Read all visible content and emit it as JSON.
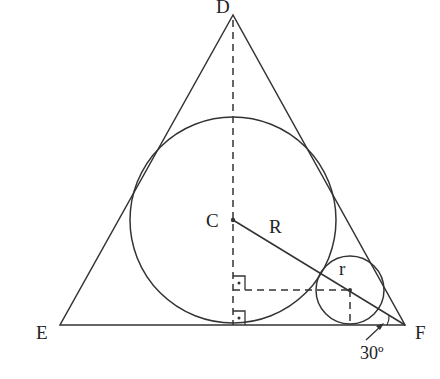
{
  "diagram": {
    "colors": {
      "stroke": "#333333",
      "background": "#ffffff",
      "text": "#222222"
    },
    "labels": {
      "D": "D",
      "E": "E",
      "F": "F",
      "C": "C",
      "R": "R",
      "r": "r",
      "angle": "30º"
    },
    "points": {
      "D": [
        233,
        15
      ],
      "E": [
        60,
        325
      ],
      "F": [
        405,
        325
      ],
      "C": [
        233,
        220
      ],
      "small_center": [
        350,
        289
      ]
    },
    "circles": [
      {
        "name": "large-incircle",
        "center": "C",
        "radius_label": "R"
      },
      {
        "name": "small-circle",
        "center": "small_center",
        "radius_label": "r"
      }
    ],
    "annotations": {
      "right_angles": 2,
      "angle_at_F": "30º"
    }
  }
}
